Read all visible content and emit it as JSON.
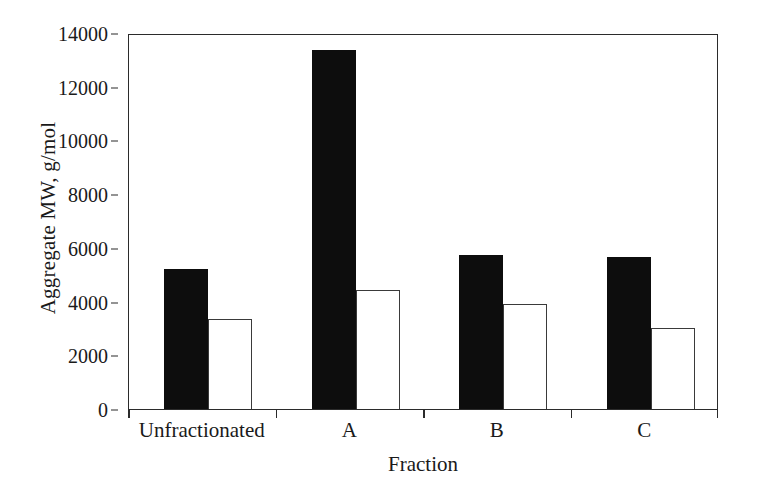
{
  "chart_data": {
    "type": "bar",
    "title": "",
    "xlabel": "Fraction",
    "ylabel": "Aggregate MW, g/mol",
    "categories": [
      "Unfractionated",
      "A",
      "B",
      "C"
    ],
    "series": [
      {
        "name": "filled",
        "style": "solid-black",
        "values": [
          5200,
          13350,
          5750,
          5650
        ]
      },
      {
        "name": "hollow",
        "style": "open-white",
        "values": [
          3350,
          4450,
          3900,
          3000
        ]
      }
    ],
    "ylim": [
      0,
      14000
    ],
    "yticks": [
      0,
      2000,
      4000,
      6000,
      8000,
      10000,
      12000,
      14000
    ],
    "ytick_labels": [
      "0",
      "2000",
      "4000",
      "6000",
      "8000",
      "10000",
      "12000",
      "14000"
    ],
    "grid": false,
    "legend": "none",
    "colors": {
      "filled_bar": "#0d0d0d",
      "hollow_bar_fill": "#ffffff",
      "hollow_bar_edge": "#3a3a3a",
      "axis": "#2b2b2b",
      "background": "#ffffff",
      "text": "#1a1a1a"
    }
  }
}
